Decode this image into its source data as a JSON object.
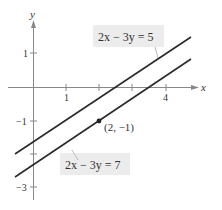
{
  "figure": {
    "axes": {
      "x_label": "x",
      "y_label": "y",
      "x_ticks": [
        {
          "value": 1,
          "label": "1"
        },
        {
          "value": 2,
          "label": ""
        },
        {
          "value": 3,
          "label": ""
        },
        {
          "value": 4,
          "label": "4"
        }
      ],
      "y_ticks": [
        {
          "value": 1,
          "label": "1"
        },
        {
          "value": -1,
          "label": "−1"
        },
        {
          "value": -2,
          "label": ""
        },
        {
          "value": -3,
          "label": "−3"
        }
      ]
    },
    "lines": [
      {
        "equation": "2x − 3y = 5",
        "color": "#2a2a2a"
      },
      {
        "equation": "2x − 3y = 7",
        "color": "#2a2a2a"
      }
    ],
    "point": {
      "label": "(2,  −1)",
      "x": 2,
      "y": -1
    },
    "label_box_color": "#ececec"
  }
}
